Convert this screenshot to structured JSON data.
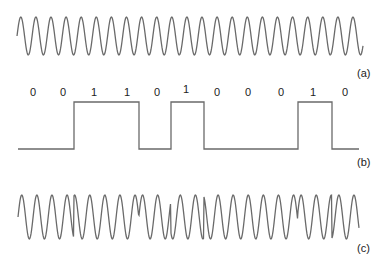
{
  "diagram": {
    "panels": [
      {
        "id": "a",
        "label": "(a)",
        "type": "carrier-sine",
        "description": "Unmodulated carrier wave"
      },
      {
        "id": "b",
        "label": "(b)",
        "type": "binary-square-wave",
        "description": "Digital bit stream"
      },
      {
        "id": "c",
        "label": "(c)",
        "type": "psk-modulated-wave",
        "description": "Phase-shift keyed signal"
      }
    ],
    "bits": [
      "0",
      "0",
      "1",
      "1",
      "0",
      "1",
      "0",
      "0",
      "0",
      "1",
      "0"
    ],
    "bit_label_x": [
      33,
      63,
      94,
      127,
      157,
      186,
      217,
      248,
      281,
      313,
      345
    ],
    "square_wave": {
      "start_x": 18,
      "end_x": 359,
      "high_y": 102,
      "low_y": 149,
      "transitions_x": [
        74,
        139,
        171,
        204,
        298,
        332
      ],
      "initial_level": "low"
    },
    "carrier": {
      "start_x": 17,
      "end_x": 363,
      "center_y": 36,
      "amplitude": 19,
      "period": 15.1
    },
    "psk": {
      "start_x": 18,
      "end_x": 359,
      "center_y": 217,
      "amplitude": 22,
      "period": 15.1,
      "phase_flip_x": [
        74,
        139,
        171,
        204,
        298,
        332
      ]
    },
    "stroke_color": "#6a6a6a"
  }
}
